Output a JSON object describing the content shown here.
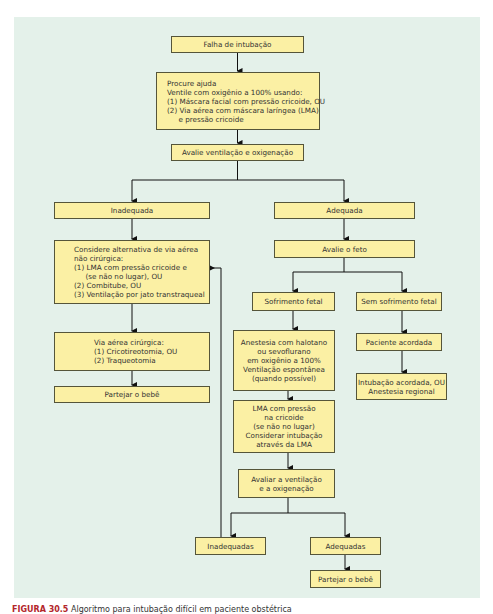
{
  "diagram": {
    "background_color": "#e4f1ea",
    "box_color": "#fbf0a4",
    "nodes": {
      "failed_intubation": "Falha de intubação",
      "call_for_help": "Procure ajuda\nVentile com oxigênio a 100% usando:\n(1) Máscara facial com pressão cricoide, OU\n(2) Via aérea com máscara laríngea (LMA)\n     e pressão cricoide",
      "assess_ventilation": "Avalie ventilação e oxigenação",
      "inadequate": "Inadequada",
      "adequate": "Adequada",
      "consider_nonsurgical": "Considere alternativa de via aérea\nnão cirúrgica:\n(1) LMA com pressão cricoide e\n     (se não no lugar), OU\n(2) Combitube, OU\n(3) Ventilação por jato transtraqueal",
      "surgical_airway": "Via aérea cirúrgica:\n(1) Cricotireotomia, OU\n(2) Traqueotomia",
      "deliver_baby_left": "Partejar o bebê",
      "assess_fetus": "Avalie o feto",
      "fetal_distress": "Sofrimento fetal",
      "no_fetal_distress": "Sem sofrimento fetal",
      "anesthesia": "Anestesia com halotano\nou sevoflurano\nem oxigênio a 100%\nVentilação espontânea\n(quando possível)",
      "awake_patient": "Paciente acordada",
      "awake_intubation": "Intubação acordada, OU\nAnestesia regional",
      "lma_cricoid": "LMA com pressão\nna cricoide\n(se não no lugar)\nConsiderar intubação\natravés da LMA",
      "reassess": "Avaliar a ventilação\ne a oxigenação",
      "inadequate_plural": "Inadequadas",
      "adequate_plural": "Adequadas",
      "deliver_baby_right": "Partejar o bebê"
    }
  },
  "caption": {
    "figure_label": "FIGURA 30.5",
    "text": "Algoritmo para intubação difícil em paciente obstétrica"
  }
}
